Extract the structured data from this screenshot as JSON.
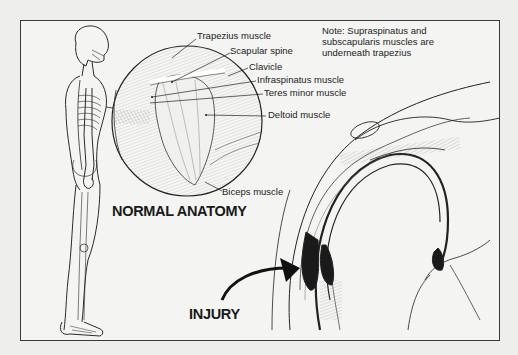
{
  "figure": {
    "note": "Note: Supraspinatus and subscapularis muscles are underneath trapezius",
    "headings": {
      "normal": "NORMAL ANATOMY",
      "injury": "INJURY"
    },
    "labels": [
      {
        "id": "trapezius",
        "text": "Trapezius muscle"
      },
      {
        "id": "scapular-spine",
        "text": "Scapular spine"
      },
      {
        "id": "clavicle",
        "text": "Clavicle"
      },
      {
        "id": "infraspinatus",
        "text": "Infraspinatus muscle"
      },
      {
        "id": "teres-minor",
        "text": "Teres minor muscle"
      },
      {
        "id": "deltoid",
        "text": "Deltoid muscle"
      },
      {
        "id": "biceps",
        "text": "Biceps muscle"
      }
    ],
    "panels": [
      {
        "id": "full-body-skeleton",
        "description": "Side view of standing human figure with skeleton"
      },
      {
        "id": "shoulder-magnified",
        "description": "Circular magnified view of shoulder muscles"
      },
      {
        "id": "injury-cross-section",
        "description": "Cross-section of shoulder joint showing bursa injury"
      }
    ],
    "colors": {
      "background": "#eeeeec",
      "ink": "#1c1c1c",
      "frame": "#3a3a3a"
    }
  }
}
